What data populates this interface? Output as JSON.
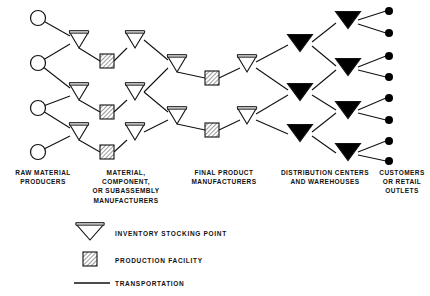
{
  "diagram": {
    "columns": [
      {
        "id": "raw-material-producers",
        "label": "RAW MATERIAL\nPRODUCERS",
        "x": 7,
        "y": 168,
        "width": 72,
        "node_type": "circle"
      },
      {
        "id": "component-manufacturers",
        "label": "MATERIAL,\nCOMPONENT,\nOR SUBASSEMBLY\nMANUFACTURERS",
        "x": 80,
        "y": 168,
        "width": 92,
        "node_type": "inventory-and-production"
      },
      {
        "id": "final-product-manufacturers",
        "label": "FINAL PRODUCT\nMANUFACTURERS",
        "x": 170,
        "y": 168,
        "width": 108,
        "node_type": "inventory-and-production"
      },
      {
        "id": "distribution-centers",
        "label": "DISTRIBUTION CENTERS\nAND WAREHOUSES",
        "x": 270,
        "y": 168,
        "width": 110,
        "node_type": "filled-triangle"
      },
      {
        "id": "customers-retail-outlets",
        "label": "CUSTOMERS\nOR RETAIL\nOUTLETS",
        "x": 375,
        "y": 168,
        "width": 54,
        "node_type": "dot"
      }
    ],
    "legend": [
      {
        "id": "inventory-stocking-point",
        "symbol": "open-triangle",
        "label": "INVENTORY  STOCKING  POINT"
      },
      {
        "id": "production-facility",
        "symbol": "hatched-square",
        "label": "PRODUCTION  FACILITY"
      },
      {
        "id": "transportation",
        "symbol": "line",
        "label": "TRANSPORTATION"
      }
    ],
    "nodes": {
      "raw_material_circles": [
        {
          "id": "rm-1",
          "cx": 38,
          "cy": 18,
          "r": 7.5
        },
        {
          "id": "rm-2",
          "cx": 38,
          "cy": 63,
          "r": 7.5
        },
        {
          "id": "rm-3",
          "cx": 38,
          "cy": 108,
          "r": 7.5
        },
        {
          "id": "rm-4",
          "cx": 38,
          "cy": 152,
          "r": 7.5
        }
      ],
      "open_triangles_col2": [
        {
          "id": "inv-c2-1",
          "cx": 79,
          "cy": 40
        },
        {
          "id": "inv-c2-2",
          "cx": 79,
          "cy": 92
        },
        {
          "id": "inv-c2-3",
          "cx": 79,
          "cy": 132
        }
      ],
      "production_squares_col2": [
        {
          "id": "prod-c2-1",
          "cx": 107,
          "cy": 61
        },
        {
          "id": "prod-c2-2",
          "cx": 107,
          "cy": 112
        },
        {
          "id": "prod-c2-3",
          "cx": 107,
          "cy": 152
        }
      ],
      "open_triangles_col3": [
        {
          "id": "inv-c3-1",
          "cx": 135,
          "cy": 40
        },
        {
          "id": "inv-c3-2",
          "cx": 135,
          "cy": 92
        },
        {
          "id": "inv-c3-3",
          "cx": 135,
          "cy": 132
        }
      ],
      "open_triangles_col4": [
        {
          "id": "inv-c4-1",
          "cx": 177,
          "cy": 64
        },
        {
          "id": "inv-c4-2",
          "cx": 177,
          "cy": 116
        }
      ],
      "production_squares_col4": [
        {
          "id": "prod-c4-1",
          "cx": 212,
          "cy": 78
        },
        {
          "id": "prod-c4-2",
          "cx": 212,
          "cy": 130
        }
      ],
      "open_triangles_col5": [
        {
          "id": "inv-c5-1",
          "cx": 247,
          "cy": 64
        },
        {
          "id": "inv-c5-2",
          "cx": 247,
          "cy": 116
        }
      ],
      "filled_triangles_col6": [
        {
          "id": "dc-c6-1",
          "cx": 300,
          "cy": 43
        },
        {
          "id": "dc-c6-2",
          "cx": 300,
          "cy": 92
        },
        {
          "id": "dc-c6-3",
          "cx": 300,
          "cy": 133
        }
      ],
      "filled_triangles_col7": [
        {
          "id": "dc-c7-1",
          "cx": 348,
          "cy": 20
        },
        {
          "id": "dc-c7-2",
          "cx": 348,
          "cy": 67
        },
        {
          "id": "dc-c7-3",
          "cx": 348,
          "cy": 110
        },
        {
          "id": "dc-c7-4",
          "cx": 348,
          "cy": 152
        }
      ],
      "customer_dots": [
        {
          "id": "cust-1",
          "cx": 389,
          "cy": 11
        },
        {
          "id": "cust-2",
          "cx": 389,
          "cy": 33
        },
        {
          "id": "cust-3",
          "cx": 389,
          "cy": 56
        },
        {
          "id": "cust-4",
          "cx": 389,
          "cy": 77
        },
        {
          "id": "cust-5",
          "cx": 389,
          "cy": 98
        },
        {
          "id": "cust-6",
          "cx": 389,
          "cy": 120
        },
        {
          "id": "cust-7",
          "cx": 389,
          "cy": 141
        },
        {
          "id": "cust-8",
          "cx": 389,
          "cy": 161
        }
      ]
    },
    "links": [
      [
        38,
        18,
        70,
        36
      ],
      [
        38,
        63,
        70,
        44
      ],
      [
        38,
        63,
        70,
        88
      ],
      [
        38,
        108,
        70,
        96
      ],
      [
        38,
        108,
        70,
        128
      ],
      [
        38,
        152,
        70,
        136
      ],
      [
        79,
        48,
        100,
        61
      ],
      [
        114,
        61,
        127,
        48
      ],
      [
        79,
        100,
        100,
        112
      ],
      [
        114,
        112,
        127,
        100
      ],
      [
        79,
        140,
        100,
        152
      ],
      [
        114,
        152,
        127,
        140
      ],
      [
        144,
        40,
        168,
        60
      ],
      [
        144,
        92,
        168,
        68
      ],
      [
        144,
        92,
        168,
        112
      ],
      [
        144,
        132,
        168,
        120
      ],
      [
        177,
        72,
        205,
        78
      ],
      [
        219,
        78,
        240,
        68
      ],
      [
        177,
        124,
        205,
        130
      ],
      [
        219,
        130,
        240,
        120
      ],
      [
        256,
        62,
        288,
        45
      ],
      [
        256,
        68,
        288,
        90
      ],
      [
        256,
        114,
        288,
        95
      ],
      [
        256,
        120,
        288,
        134
      ],
      [
        312,
        42,
        336,
        23
      ],
      [
        312,
        46,
        336,
        66
      ],
      [
        312,
        90,
        336,
        70
      ],
      [
        312,
        95,
        336,
        110
      ],
      [
        312,
        132,
        336,
        113
      ],
      [
        312,
        136,
        336,
        153
      ],
      [
        358,
        20,
        386,
        11
      ],
      [
        358,
        24,
        386,
        33
      ],
      [
        358,
        67,
        386,
        56
      ],
      [
        358,
        70,
        386,
        77
      ],
      [
        358,
        110,
        386,
        98
      ],
      [
        358,
        113,
        386,
        120
      ],
      [
        358,
        152,
        386,
        141
      ],
      [
        358,
        155,
        386,
        161
      ]
    ]
  }
}
